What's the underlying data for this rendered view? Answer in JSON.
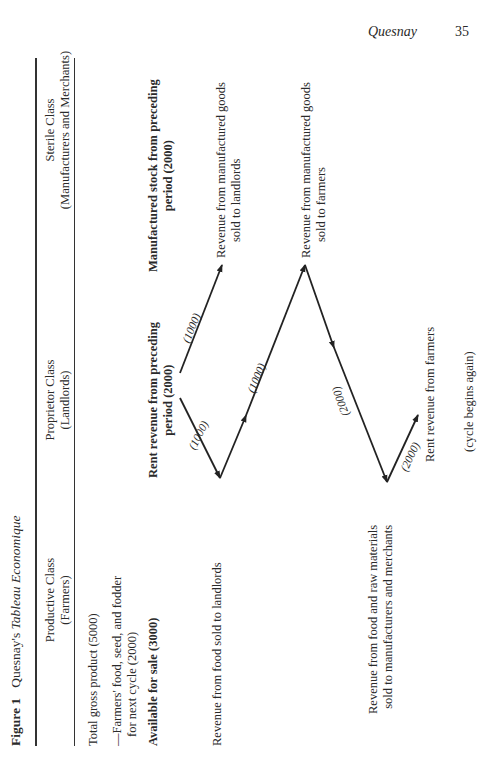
{
  "page_header": {
    "running_head": "Quesnay",
    "page_number": "35"
  },
  "figure": {
    "label": "Figure 1",
    "title_prefix": "Quesnay's ",
    "title_italic": "Tableau Economique",
    "orientation": "rotated 90° counter-clockwise (landscape)",
    "columns": [
      {
        "name": "Productive Class",
        "sub": "(Farmers)"
      },
      {
        "name": "Proprietor Class",
        "sub": "(Landlords)"
      },
      {
        "name": "Sterile Class",
        "sub": "(Manufacturers and Merchants)"
      }
    ],
    "productive_entries": {
      "total": "Total gross product (5000)",
      "farmers_line1": "—Farmers' food, seed, and fodder",
      "farmers_line2": "for next cycle (2000)",
      "available": "Available for sale (3000)",
      "rev_landlords": "Revenue from food sold to landlords",
      "rev_raw_line1": "Revenue from food and raw materials",
      "rev_raw_line2": "sold to manufacturers and merchants"
    },
    "proprietor_entries": {
      "rent_line1": "Rent revenue from preceding",
      "rent_line2": "period (2000)",
      "rent_farmers": "Rent revenue from farmers",
      "cycle": "(cycle begins again)"
    },
    "sterile_entries": {
      "stock_line1": "Manufactured stock from preceding",
      "stock_line2": "period (2000)",
      "rev_land_line1": "Revenue from manufactured goods",
      "rev_land_line2": "sold to landlords",
      "rev_farm_line1": "Revenue from manufactured goods",
      "rev_farm_line2": "sold to farmers"
    },
    "flows": [
      {
        "label": "(1000)",
        "from": "Proprietor rent",
        "to": "Productive: food sold to landlords"
      },
      {
        "label": "(1000)",
        "from": "Proprietor rent",
        "to": "Sterile: goods sold to landlords"
      },
      {
        "label": "(1000)",
        "from": "Productive: food sold to landlords",
        "to": "Sterile: goods sold to farmers"
      },
      {
        "label": "(2000)",
        "from": "Sterile: goods sold to farmers",
        "to": "Productive: food & raw materials"
      },
      {
        "label": "(2000)",
        "from": "Productive: food & raw materials",
        "to": "Proprietor: rent from farmers"
      }
    ]
  }
}
